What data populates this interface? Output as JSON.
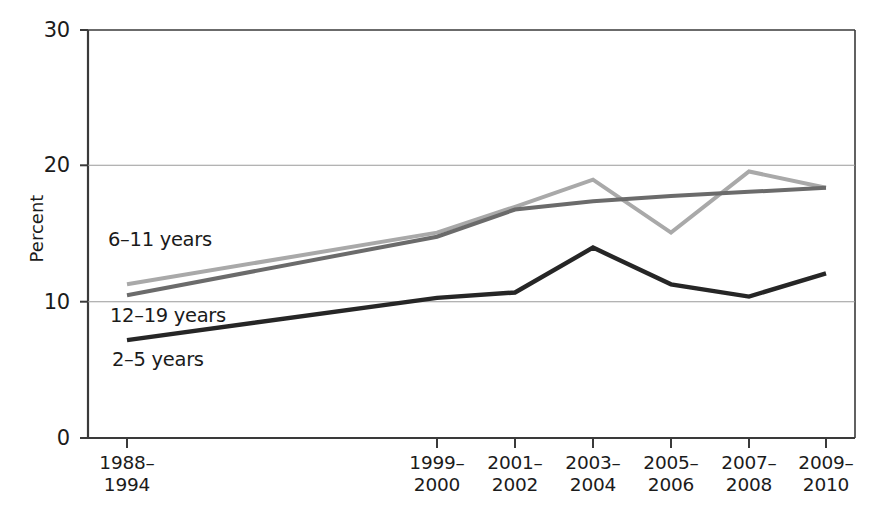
{
  "chart_data": {
    "type": "line",
    "title": "",
    "subtitle": "",
    "xlabel": "",
    "ylabel": "Percent",
    "categories": [
      "1988–1994",
      "1999–2000",
      "2001–2002",
      "2003–2004",
      "2005–2006",
      "2007–2008",
      "2009–2010"
    ],
    "category_lines": [
      [
        "1988–",
        "1994"
      ],
      [
        "1999–",
        "2000"
      ],
      [
        "2001–",
        "2002"
      ],
      [
        "2003–",
        "2004"
      ],
      [
        "2005–",
        "2006"
      ],
      [
        "2007–",
        "2008"
      ],
      [
        "2009–",
        "2010"
      ]
    ],
    "ylim": [
      0,
      30
    ],
    "yticks": [
      0,
      10,
      20,
      30
    ],
    "ytick_labels": [
      "0",
      "10",
      "20",
      "30"
    ],
    "grid": "horizontal",
    "legend_position": "inline-labels",
    "series": [
      {
        "name": "2–5 years",
        "color": "#262626",
        "values": [
          7.2,
          10.3,
          10.7,
          14.0,
          11.3,
          10.4,
          12.1
        ]
      },
      {
        "name": "6–11 years",
        "color": "#a9a9a9",
        "values": [
          11.3,
          15.1,
          17.0,
          19.0,
          15.1,
          19.6,
          18.4
        ]
      },
      {
        "name": "12–19 years",
        "color": "#6b6b6b",
        "values": [
          10.5,
          14.8,
          16.8,
          17.4,
          17.8,
          18.1,
          18.4
        ]
      }
    ],
    "annotations": [
      {
        "text": "6–11 years",
        "series": "6–11 years"
      },
      {
        "text": "12–19 years",
        "series": "12–19 years"
      },
      {
        "text": "2–5 years",
        "series": "2–5 years"
      }
    ]
  },
  "axes": {
    "ylabel": "Percent",
    "ytick_0": "0",
    "ytick_10": "10",
    "ytick_20": "20",
    "ytick_30": "30"
  },
  "series_labels": {
    "age_6_11": "6–11 years",
    "age_12_19": "12–19 years",
    "age_2_5": "2–5 years"
  },
  "xticks": {
    "t0_line1": "1988–",
    "t0_line2": "1994",
    "t1_line1": "1999–",
    "t1_line2": "2000",
    "t2_line1": "2001–",
    "t2_line2": "2002",
    "t3_line1": "2003–",
    "t3_line2": "2004",
    "t4_line1": "2005–",
    "t4_line2": "2006",
    "t5_line1": "2007–",
    "t5_line2": "2008",
    "t6_line1": "2009–",
    "t6_line2": "2010"
  },
  "colors": {
    "axis": "#3a3a3a",
    "grid": "#9a9a9a",
    "series_2_5": "#262626",
    "series_6_11": "#a9a9a9",
    "series_12_19": "#6b6b6b",
    "text": "#1b1b1b",
    "background": "#ffffff"
  }
}
